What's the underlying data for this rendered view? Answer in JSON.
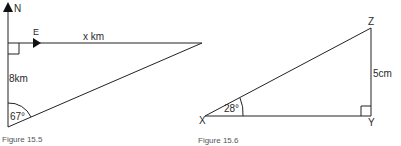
{
  "figures": [
    {
      "caption": "Figure 15.5",
      "labels": {
        "north": "N",
        "east": "E",
        "top_side": "x km",
        "left_side": "8km",
        "angle": "67°"
      }
    },
    {
      "caption": "Figure 15.6",
      "labels": {
        "vertex_x": "X",
        "vertex_y": "Y",
        "vertex_z": "Z",
        "right_side": "5cm",
        "angle": "28°"
      }
    }
  ]
}
